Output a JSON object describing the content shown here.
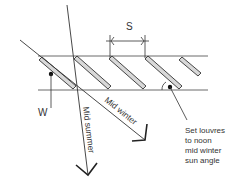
{
  "diagram": {
    "labels": {
      "spacing": "S",
      "width": "W",
      "mid_winter": "Mid winter",
      "mid_summer": "Mid summer",
      "note_line1": "Set louvres",
      "note_line2": "to noon",
      "note_line3": "mid winter",
      "note_line4": "sun angle"
    },
    "louvre_count": 5,
    "colors": {
      "line": "#333333",
      "louvre_fill": "#d8d8d8"
    }
  }
}
